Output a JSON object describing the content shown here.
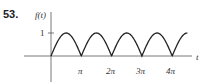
{
  "problem_number": "53.",
  "chart_data": {
    "type": "line",
    "title": "",
    "function": "f(t) = |sin t|",
    "ylabel": "f(t)",
    "xlabel": "t",
    "x_ticks": [
      "π",
      "2π",
      "3π",
      "4π"
    ],
    "y_ticks": [
      "1"
    ],
    "xlim": [
      0,
      4.5
    ],
    "ylim": [
      0,
      1
    ],
    "x": [
      0,
      0.5,
      1,
      1.5,
      2,
      2.5,
      3,
      3.5,
      4,
      4.5
    ],
    "x_units": "π",
    "values": [
      0,
      1,
      0,
      1,
      0,
      1,
      0,
      1,
      0,
      1
    ],
    "grid": false,
    "legend": null
  },
  "labels": {
    "ylabel": "f(t)",
    "xlabel": "t",
    "y_tick": "1",
    "x_ticks": [
      "π",
      "2π",
      "3π",
      "4π"
    ]
  }
}
